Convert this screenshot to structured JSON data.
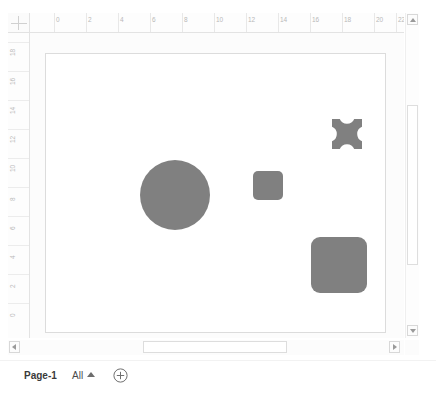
{
  "app": {
    "name": "visio-drawing-canvas",
    "canvas_background": "#fcfcfc",
    "page_background": "#ffffff",
    "shape_fill": "#808080",
    "ruler_label_color": "#bababa"
  },
  "ruler_horizontal": {
    "name": "horizontal-ruler",
    "unit": "in",
    "labels": [
      "0",
      "2",
      "4",
      "6",
      "8",
      "10",
      "12",
      "14",
      "16",
      "18",
      "20",
      "22"
    ],
    "positions": [
      24,
      56,
      88,
      120,
      152,
      184,
      216,
      248,
      280,
      312,
      344,
      366
    ]
  },
  "ruler_vertical": {
    "name": "vertical-ruler",
    "unit": "in",
    "labels": [
      "18",
      "16",
      "14",
      "12",
      "10",
      "8",
      "6",
      "4",
      "2",
      "0"
    ],
    "positions": [
      9,
      38,
      67,
      96,
      125,
      154,
      183,
      212,
      241,
      270
    ]
  },
  "canvas": {
    "page_label": "drawing-page",
    "shapes": [
      {
        "id": "shape-circle",
        "name": "circle-shape",
        "type": "circle",
        "x": 94,
        "y": 106,
        "width": 70,
        "height": 70,
        "fill": "#808080"
      },
      {
        "id": "shape-small-roundrect",
        "name": "small-rounded-rect-shape",
        "type": "rounded-rect",
        "x": 207,
        "y": 117,
        "width": 30,
        "height": 29,
        "radius": 5,
        "fill": "#808080"
      },
      {
        "id": "shape-notched-square",
        "name": "notched-square-shape",
        "type": "notched-square",
        "x": 286,
        "y": 65,
        "width": 30,
        "height": 30,
        "fill": "#808080"
      },
      {
        "id": "shape-large-roundrect",
        "name": "large-rounded-rect-shape",
        "type": "rounded-rect",
        "x": 265,
        "y": 183,
        "width": 56,
        "height": 56,
        "radius": 9,
        "fill": "#808080"
      }
    ]
  },
  "scrollbars": {
    "vertical": {
      "name": "vertical-scrollbar",
      "up_icon": "triangle-up-icon",
      "down_icon": "triangle-down-icon",
      "thumb_top": 92,
      "thumb_height": 160
    },
    "horizontal": {
      "name": "horizontal-scrollbar",
      "left_icon": "triangle-left-icon",
      "right_icon": "triangle-right-icon",
      "thumb_left": 135,
      "thumb_width": 144
    }
  },
  "status_bar": {
    "page_tab_label": "Page-1",
    "all_pages_label": "All",
    "all_pages_caret_icon": "caret-up-icon",
    "add_page_icon": "plus-circle-icon"
  }
}
